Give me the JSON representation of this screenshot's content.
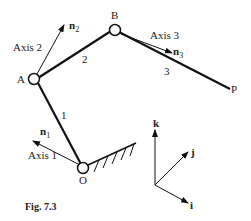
{
  "figure": {
    "caption": "Fig. 7.3",
    "points": {
      "O": "O",
      "A": "A",
      "B": "B",
      "P": "P"
    },
    "links": {
      "l1": "1",
      "l2": "2",
      "l3": "3"
    },
    "axes": {
      "a1": "Axis 1",
      "a2": "Axis 2",
      "a3": "Axis 3"
    },
    "normals": {
      "n1": "n",
      "n1_sub": "1",
      "n2": "n",
      "n2_sub": "2",
      "n3": "n",
      "n3_sub": "3"
    },
    "frame": {
      "i": "i",
      "j": "j",
      "k": "k"
    }
  }
}
